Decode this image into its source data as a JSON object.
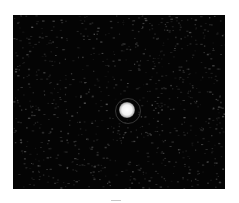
{
  "image": {
    "description": "Dark speckle-noise field with a single bright circular spot near the center",
    "background_color": "#ffffff",
    "field_color": "#040404",
    "spot_color": "#ffffff"
  },
  "field": {
    "x": 13,
    "y": 15,
    "width": 212,
    "height": 174
  },
  "spot": {
    "cx": 127,
    "cy": 110,
    "radius": 8,
    "halo_radius": 12
  },
  "caption_mark": {
    "x": 111,
    "y": 200,
    "width": 10
  }
}
